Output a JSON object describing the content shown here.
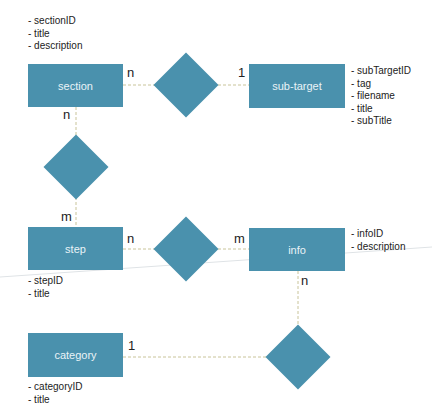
{
  "colors": {
    "entity_fill": "#4a91ad",
    "entity_text": "#e9f3f7",
    "connector": "#c9c49a"
  },
  "entities": {
    "section": {
      "label": "section",
      "attributes": [
        "- sectionID",
        "- title",
        "- description"
      ]
    },
    "subtarget": {
      "label": "sub-target",
      "attributes": [
        "- subTargetID",
        "- tag",
        "- filename",
        "- title",
        "- subTitle"
      ]
    },
    "step": {
      "label": "step",
      "attributes": [
        "- stepID",
        "- title"
      ]
    },
    "info": {
      "label": "info",
      "attributes": [
        "- infoID",
        "- description"
      ]
    },
    "category": {
      "label": "category",
      "attributes": [
        "- categoryID",
        "- title"
      ]
    }
  },
  "relationships": {
    "section_subtarget": {
      "left": "n",
      "right": "1"
    },
    "section_step": {
      "top": "n",
      "bottom": "m"
    },
    "step_info": {
      "left": "n",
      "right": "m"
    },
    "info_category": {
      "top": "n",
      "left": "1"
    }
  }
}
